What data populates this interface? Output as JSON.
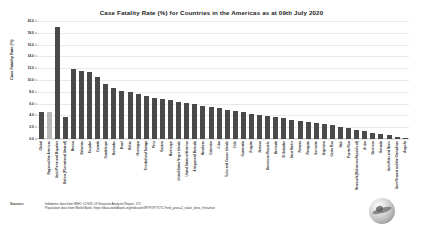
{
  "chart_data": {
    "type": "bar",
    "title": "Case Fatality Rate (%) for Countries in the Americas as at 09th July 2020",
    "xlabel": "",
    "ylabel": "Case Fatality Rate (%)",
    "ylim": [
      0.0,
      20.0
    ],
    "ytick_labels": [
      "0.0",
      "2.0",
      "4.0",
      "6.0",
      "8.0",
      "10.0",
      "12.0",
      "14.0",
      "16.0",
      "18.0",
      "20.0"
    ],
    "ytick_values": [
      0.0,
      2.0,
      4.0,
      6.0,
      8.0,
      10.0,
      12.0,
      14.0,
      16.0,
      18.0,
      20.0
    ],
    "grid": true,
    "legend": "none",
    "bar_color": "#4a4a4a",
    "highlight_color": "#b9b9b9",
    "categories": [
      "Global",
      "Region of the Americas",
      "Saint Pierre and Miquelon",
      "Bolivia (Plurinational State of)",
      "Mexico",
      "Bahamas",
      "Ecuador",
      "Canada",
      "Guadeloupe",
      "Barbados",
      "Brazil",
      "Belize",
      "Nicaragua",
      "Trinidad and Tobago",
      "Peru",
      "Guyana",
      "Martinique",
      "United States Virgin Islands",
      "United States of America",
      "Antigua and Barbuda",
      "Honduras",
      "Colombia",
      "Cuba",
      "Turks and Caicos Islands",
      "Chile",
      "Guatemala",
      "Uruguay",
      "Jamaica",
      "Dominican Republic",
      "Bermuda",
      "El Salvador",
      "Saint Martin",
      "Panama",
      "Paraguay",
      "Suriname",
      "Argentina",
      "Costa Rica",
      "Haiti",
      "Puerto Rico",
      "Venezuela (Bolivarian Republic of)",
      "Aruba",
      "Dominica",
      "Grenada",
      "Saint Kitts and Nevis",
      "Saint Vincent and the Grenadines",
      "Anguilla"
    ],
    "values": [
      4.5,
      4.6,
      19.0,
      3.7,
      11.9,
      11.6,
      11.4,
      10.5,
      9.3,
      8.6,
      8.1,
      7.9,
      7.6,
      7.3,
      7.0,
      6.8,
      6.6,
      6.3,
      6.1,
      5.9,
      5.6,
      5.4,
      5.2,
      5.0,
      4.7,
      4.5,
      4.3,
      4.1,
      3.9,
      3.7,
      3.5,
      3.3,
      3.1,
      2.9,
      2.7,
      2.5,
      2.3,
      2.1,
      1.9,
      1.6,
      1.3,
      1.0,
      0.8,
      0.6,
      0.4,
      0.2
    ],
    "highlight_indices": [
      1
    ]
  },
  "footer": {
    "sources_label": "Sources:",
    "source_1": "Infodemic data from WHO COVID-19 Situation Analysis Report, 171",
    "source_2": "Population data from World Bank: https://data.worldbank.org/indicator/SP.POP.TOTL?end_year=2_value_desc_first=true"
  },
  "logo": {
    "name": "organization-globe-logo"
  }
}
